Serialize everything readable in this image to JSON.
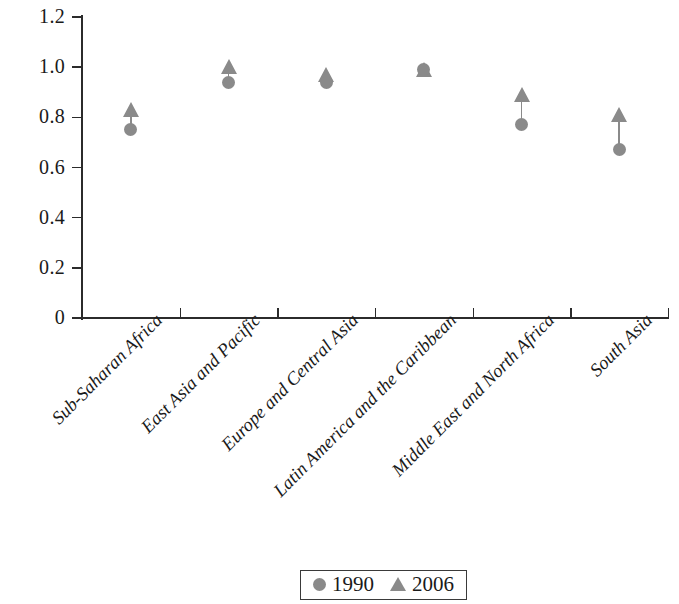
{
  "chart_data": {
    "type": "scatter",
    "title": "",
    "xlabel": "",
    "ylabel": "ratio",
    "ylim": [
      0,
      1.2
    ],
    "yticks": [
      "0",
      "0.2",
      "0.4",
      "0.6",
      "0.8",
      "1.0",
      "1.2"
    ],
    "ytick_values": [
      0,
      0.2,
      0.4,
      0.6,
      0.8,
      1.0,
      1.2
    ],
    "grid": false,
    "legend_position": "bottom-center",
    "categories": [
      "Sub-Saharan Africa",
      "East Asia and Pacific",
      "Europe and Central Asia",
      "Latin America and the Caribbean",
      "Middle East and North Africa",
      "South Asia"
    ],
    "series": [
      {
        "name": "1990",
        "marker": "circle",
        "color": "#8a8a8a",
        "values": [
          0.75,
          0.94,
          0.94,
          0.99,
          0.77,
          0.67
        ]
      },
      {
        "name": "2006",
        "marker": "triangle",
        "color": "#8a8a8a",
        "values": [
          0.83,
          1.0,
          0.97,
          0.99,
          0.89,
          0.81
        ]
      }
    ]
  },
  "legend": {
    "items": [
      {
        "label": "1990",
        "marker": "circle-marker-icon"
      },
      {
        "label": "2006",
        "marker": "triangle-marker-icon"
      }
    ]
  },
  "axis": {
    "y_title": "ratio"
  }
}
